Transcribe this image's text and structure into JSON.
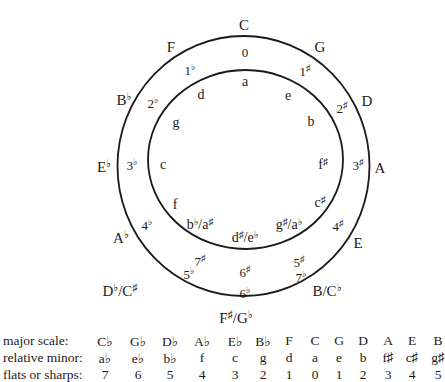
{
  "circle": {
    "stroke_color": "#1a1a1a",
    "outer": {
      "cx": 243.5,
      "cy": 166,
      "rx": 126,
      "ry": 130
    },
    "inner": {
      "cx": 245.5,
      "cy": 159.5,
      "rx": 97.5,
      "ry": 89.5
    }
  },
  "major_keys": [
    {
      "label": "C",
      "x": 244,
      "y": 25
    },
    {
      "label": "G",
      "x": 320,
      "y": 47
    },
    {
      "label": "D",
      "x": 367,
      "y": 101
    },
    {
      "label": "A",
      "x": 380,
      "y": 168
    },
    {
      "label": "E",
      "x": 358,
      "y": 243
    },
    {
      "label": "B/C♭",
      "x": 327,
      "y": 291
    },
    {
      "label": "F♯/G♭",
      "x": 236,
      "y": 318
    },
    {
      "label": "D♭/C♯",
      "x": 120,
      "y": 291
    },
    {
      "label": "A♭",
      "x": 121,
      "y": 238
    },
    {
      "label": "E♭",
      "x": 104,
      "y": 167
    },
    {
      "label": "B♭",
      "x": 124,
      "y": 100
    },
    {
      "label": "F",
      "x": 171,
      "y": 47
    }
  ],
  "accidental_counts": [
    {
      "label": "0",
      "x": 245,
      "y": 52
    },
    {
      "label": "1♯",
      "x": 305,
      "y": 71
    },
    {
      "label": "2♯",
      "x": 342,
      "y": 108
    },
    {
      "label": "3♯",
      "x": 358,
      "y": 165
    },
    {
      "label": "4♯",
      "x": 338,
      "y": 226
    },
    {
      "label": "5♯",
      "x": 299,
      "y": 262
    },
    {
      "label": "6♯",
      "x": 245,
      "y": 272
    },
    {
      "label": "7♯",
      "x": 200,
      "y": 261
    },
    {
      "label": "7♭",
      "x": 301,
      "y": 277
    },
    {
      "label": "6♭",
      "x": 245,
      "y": 293
    },
    {
      "label": "5♭",
      "x": 189,
      "y": 274
    },
    {
      "label": "4♭",
      "x": 147,
      "y": 225
    },
    {
      "label": "3♭",
      "x": 132,
      "y": 165
    },
    {
      "label": "2♭",
      "x": 153,
      "y": 103
    },
    {
      "label": "1♭",
      "x": 190,
      "y": 70
    }
  ],
  "minor_keys": [
    {
      "label": "a",
      "x": 245,
      "y": 82
    },
    {
      "label": "e",
      "x": 288,
      "y": 96
    },
    {
      "label": "b",
      "x": 311,
      "y": 122
    },
    {
      "label": "f♯",
      "x": 323,
      "y": 165
    },
    {
      "label": "c♯",
      "x": 320,
      "y": 203
    },
    {
      "label": "g♯/a♭",
      "x": 289,
      "y": 225
    },
    {
      "label": "d♯/e♭",
      "x": 245,
      "y": 238
    },
    {
      "label": "b♭/a♯",
      "x": 200,
      "y": 225
    },
    {
      "label": "f",
      "x": 175,
      "y": 205
    },
    {
      "label": "c",
      "x": 163,
      "y": 165
    },
    {
      "label": "g",
      "x": 176,
      "y": 123
    },
    {
      "label": "d",
      "x": 201,
      "y": 95
    }
  ],
  "table": {
    "rows": [
      {
        "label": "major scale:",
        "y": 333,
        "values": [
          "C♭",
          "G♭",
          "D♭",
          "A♭",
          "E♭",
          "B♭",
          "F",
          "C",
          "G",
          "D",
          "A",
          "E",
          "B"
        ]
      },
      {
        "label": "relative minor:",
        "y": 350,
        "values": [
          "a♭",
          "e♭",
          "b♭",
          "f",
          "c",
          "g",
          "d",
          "a",
          "e",
          "b",
          "f♯",
          "c♯",
          "g♯"
        ]
      },
      {
        "label": "flats or sharps:",
        "y": 367,
        "values": [
          "7",
          "6",
          "5",
          "4",
          "3",
          "2",
          "1",
          "0",
          "1",
          "2",
          "3",
          "4",
          "5"
        ]
      }
    ],
    "column_x": [
      105,
      138,
      170,
      202,
      235,
      263,
      289,
      315,
      339,
      363,
      388,
      412,
      438
    ]
  }
}
